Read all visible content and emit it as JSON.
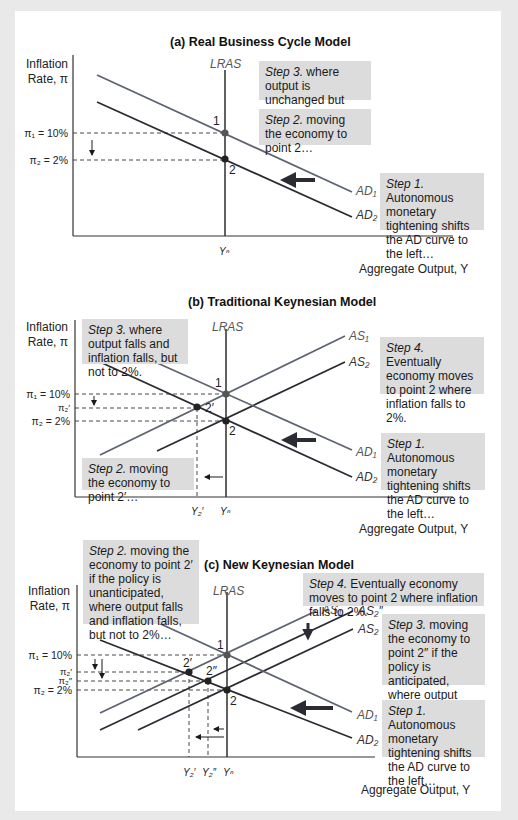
{
  "colors": {
    "frame_bg": "#e9e9e9",
    "panel_bg": "#ffffff",
    "dark_line": "#2b2b33",
    "light_line": "#5d6470",
    "lras_line": "#3a3a3a",
    "step_box_bg": "#dcdcdc",
    "point": "#333333"
  },
  "panels": [
    {
      "id": "a",
      "title": "(a) Real Business Cycle Model",
      "y_axis_label": [
        "Inflation",
        "Rate, π"
      ],
      "x_axis_label": "Aggregate Output, Y",
      "lras_label": "LRAS",
      "y_ticks": [
        {
          "label": "π₁ = 10%",
          "y": 133
        },
        {
          "label": "π₂ = 2%",
          "y": 160
        }
      ],
      "x_ticks": [
        {
          "label": "Yⁿ",
          "x": 225
        }
      ],
      "steps": [
        {
          "num": "Step 3.",
          "text": " where output is unchanged but inflation falls to 2%."
        },
        {
          "num": "Step 2.",
          "text": " moving the economy to point 2…"
        },
        {
          "num": "Step 1.",
          "text": " Autonomous monetary tightening shifts the AD curve to the left…"
        }
      ],
      "curves": [
        {
          "label": "AD₁",
          "kind": "AD"
        },
        {
          "label": "AD₂",
          "kind": "AD"
        }
      ],
      "points": [
        {
          "label": "1",
          "x": 225,
          "y": 133
        },
        {
          "label": "2",
          "x": 225,
          "y": 159
        }
      ]
    },
    {
      "id": "b",
      "title": "(b) Traditional Keynesian Model",
      "y_axis_label": [
        "Inflation",
        "Rate, π"
      ],
      "x_axis_label": "Aggregate Output, Y",
      "lras_label": "LRAS",
      "y_ticks": [
        {
          "label": "π₁ = 10%",
          "y": 394
        },
        {
          "label": "π₂′",
          "y": 408
        },
        {
          "label": "π₂ = 2%",
          "y": 421
        }
      ],
      "x_ticks": [
        {
          "label": "Y₂′",
          "x": 197
        },
        {
          "label": "Yⁿ",
          "x": 226
        }
      ],
      "steps": [
        {
          "num": "Step 3.",
          "text": " where output falls and inflation falls, but not to 2%."
        },
        {
          "num": "Step 4.",
          "text": " Eventually economy moves to point 2 where inflation falls to 2%."
        },
        {
          "num": "Step 2.",
          "text": " moving the economy to point 2′…"
        },
        {
          "num": "Step 1.",
          "text": " Autonomous monetary tightening shifts the AD curve to the left…"
        }
      ],
      "curves": [
        {
          "label": "AS₁",
          "kind": "AS"
        },
        {
          "label": "AS₂",
          "kind": "AS"
        },
        {
          "label": "AD₁",
          "kind": "AD"
        },
        {
          "label": "AD₂",
          "kind": "AD"
        }
      ],
      "points": [
        {
          "label": "1",
          "x": 226,
          "y": 394
        },
        {
          "label": "2′",
          "x": 197,
          "y": 407
        },
        {
          "label": "2",
          "x": 226,
          "y": 421
        }
      ]
    },
    {
      "id": "c",
      "title": "(c) New Keynesian Model",
      "y_axis_label": [
        "Inflation",
        "Rate, π"
      ],
      "x_axis_label": "Aggregate Output, Y",
      "lras_label": "LRAS",
      "y_ticks": [
        {
          "label": "π₁ = 10%",
          "y": 655
        },
        {
          "label": "π₂′",
          "y": 672
        },
        {
          "label": "π₂″",
          "y": 681
        },
        {
          "label": "π₂ = 2%",
          "y": 690
        }
      ],
      "x_ticks": [
        {
          "label": "Y₂′",
          "x": 189
        },
        {
          "label": "Y₂″",
          "x": 208
        },
        {
          "label": "Yⁿ",
          "x": 227
        }
      ],
      "steps": [
        {
          "num": "Step 2.",
          "text": " moving the economy to point 2′ if the policy is unanticipated, where output falls and inflation falls, but not to 2%…"
        },
        {
          "num": "Step 4.",
          "text": " Eventually economy moves to point 2 where inflation falls to 2%."
        },
        {
          "num": "Step 3.",
          "text": " moving the economy to point 2″ if the policy is anticipated, where output falls by less and inflation by more."
        },
        {
          "num": "Step 1.",
          "text": " Autonomous monetary tightening shifts the AD curve to the left…"
        }
      ],
      "curves": [
        {
          "label": "AS₁",
          "kind": "AS"
        },
        {
          "label": "AS₂″",
          "kind": "AS"
        },
        {
          "label": "AS₂",
          "kind": "AS"
        },
        {
          "label": "AD₁",
          "kind": "AD"
        },
        {
          "label": "AD₂",
          "kind": "AD"
        }
      ],
      "points": [
        {
          "label": "1",
          "x": 227,
          "y": 655
        },
        {
          "label": "2′",
          "x": 189,
          "y": 672
        },
        {
          "label": "2″",
          "x": 208,
          "y": 681
        },
        {
          "label": "2",
          "x": 227,
          "y": 690
        }
      ]
    }
  ]
}
